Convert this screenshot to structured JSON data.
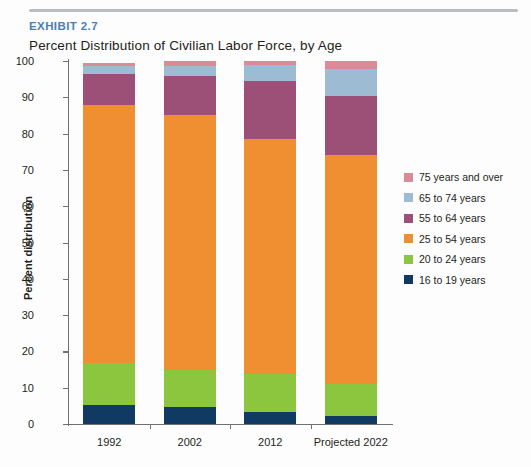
{
  "header": {
    "exhibit_label": "EXHIBIT 2.7",
    "title": "Percent Distribution of Civilian Labor Force, by Age"
  },
  "chart_data": {
    "type": "bar",
    "subtype": "stacked-percent",
    "title": "Percent Distribution of Civilian Labor Force, by Age",
    "xlabel": "",
    "ylabel": "Percent distribution",
    "ylim": [
      0,
      100
    ],
    "yticks": [
      0,
      10,
      20,
      30,
      40,
      50,
      60,
      70,
      80,
      90,
      100
    ],
    "ytick_labels": [
      "0",
      "10",
      "20",
      "30",
      "40",
      "50",
      "60",
      "70",
      "80",
      "90",
      "100"
    ],
    "grid": false,
    "legend_position": "right",
    "categories": [
      "1992",
      "2002",
      "2012",
      "Projected 2022"
    ],
    "series": [
      {
        "name": "16 to 19 years",
        "color": "#113a63",
        "values": [
          5.2,
          4.7,
          3.3,
          2.2
        ]
      },
      {
        "name": "20 to 24 years",
        "color": "#8cc63e",
        "values": [
          11.6,
          10.2,
          10.5,
          8.8
        ]
      },
      {
        "name": "25 to 54 years",
        "color": "#ef8f32",
        "values": [
          71.2,
          70.3,
          64.8,
          63.0
        ]
      },
      {
        "name": "55 to 64 years",
        "color": "#9c4f77",
        "values": [
          8.3,
          10.7,
          15.8,
          16.5
        ]
      },
      {
        "name": "65 to 74 years",
        "color": "#9dbcd4",
        "values": [
          2.2,
          2.8,
          4.4,
          7.2
        ]
      },
      {
        "name": "75 years and over",
        "color": "#d98b96",
        "values": [
          1.0,
          1.3,
          1.2,
          2.3
        ]
      }
    ],
    "legend_entries": [
      {
        "label": "75 years and over",
        "color": "#d98b96"
      },
      {
        "label": "65 to 74 years",
        "color": "#9dbcd4"
      },
      {
        "label": "55 to 64 years",
        "color": "#9c4f77"
      },
      {
        "label": "25 to 54 years",
        "color": "#ef8f32"
      },
      {
        "label": "20 to 24 years",
        "color": "#8cc63e"
      },
      {
        "label": "16 to 19 years",
        "color": "#113a63"
      }
    ]
  },
  "colors": {
    "exhibit_accent": "#4a7fb5",
    "axis": "#6f6f6f",
    "rule": "#b9bec4"
  }
}
